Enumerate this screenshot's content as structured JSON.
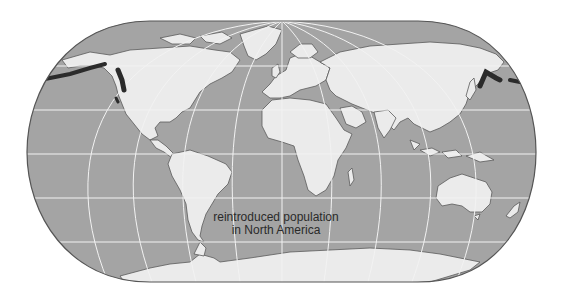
{
  "map": {
    "projection": "Robinson-style world map",
    "colors": {
      "ocean": "#a4a4a4",
      "land": "#ebebeb",
      "coast": "#555555",
      "graticule": "#f2f2f2",
      "border": "#555555",
      "range_highlight": "#2b2b2b"
    },
    "annotation": {
      "line1": "reintroduced population",
      "line2": "in North America"
    }
  }
}
